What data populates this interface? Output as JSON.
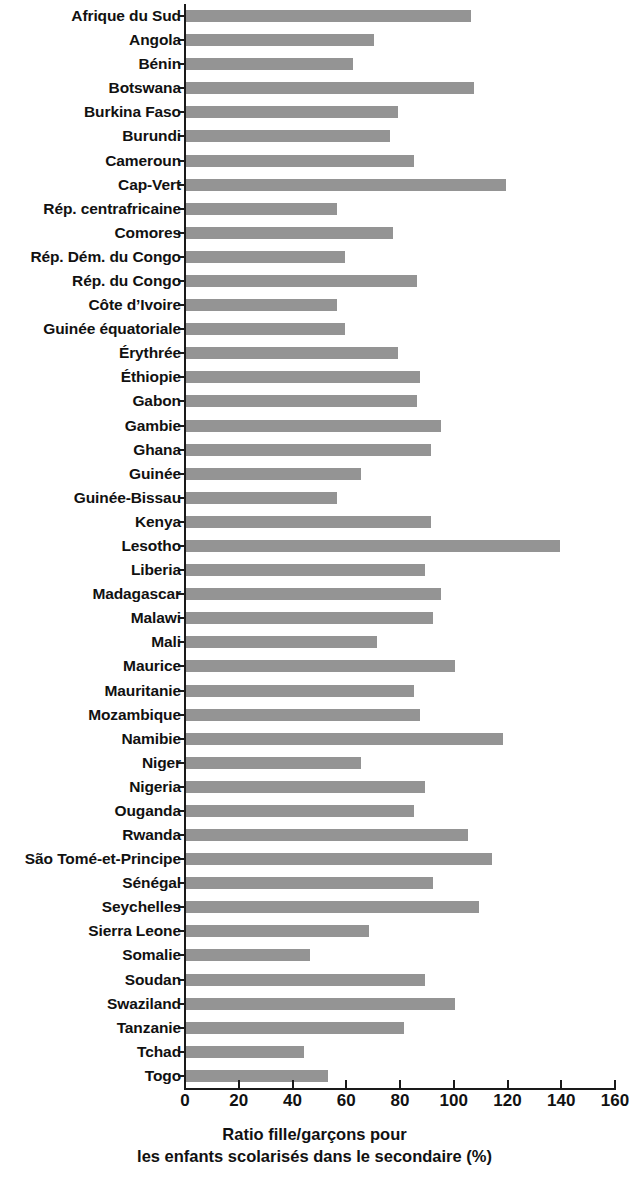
{
  "chart_data": {
    "type": "bar",
    "orientation": "horizontal",
    "title": "",
    "xlabel": "Ratio fille/garçons pour les enfants scolarisés dans le secondaire (%)",
    "xlabel_line1": "Ratio fille/garçons pour",
    "xlabel_line2": "les enfants scolarisés dans le secondaire (%)",
    "ylabel": "",
    "xlim": [
      0,
      160
    ],
    "xticks": [
      0,
      20,
      40,
      60,
      80,
      100,
      120,
      140,
      160
    ],
    "xtick_labels": [
      "0",
      "20",
      "40",
      "60",
      "80",
      "100",
      "120",
      "140",
      "160"
    ],
    "grid": false,
    "legend": null,
    "bar_color": "#949494",
    "axis_color": "#1a1a1a",
    "categories": [
      "Afrique du Sud",
      "Angola",
      "Bénin",
      "Botswana",
      "Burkina Faso",
      "Burundi",
      "Cameroun",
      "Cap-Vert",
      "Rép. centrafricaine",
      "Comores",
      "Rép. Dém. du Congo",
      "Rép. du Congo",
      "Côte d’Ivoire",
      "Guinée équatoriale",
      "Érythrée",
      "Éthiopie",
      "Gabon",
      "Gambie",
      "Ghana",
      "Guinée",
      "Guinée-Bissau",
      "Kenya",
      "Lesotho",
      "Liberia",
      "Madagascar",
      "Malawi",
      "Mali",
      "Maurice",
      "Mauritanie",
      "Mozambique",
      "Namibie",
      "Niger",
      "Nigeria",
      "Ouganda",
      "Rwanda",
      "São Tomé-et-Principe",
      "Sénégal",
      "Seychelles",
      "Sierra Leone",
      "Somalie",
      "Soudan",
      "Swaziland",
      "Tanzanie",
      "Tchad",
      "Togo"
    ],
    "values": [
      106,
      70,
      62,
      107,
      79,
      76,
      85,
      119,
      56,
      77,
      59,
      86,
      56,
      59,
      79,
      87,
      86,
      95,
      91,
      65,
      56,
      91,
      139,
      89,
      95,
      92,
      71,
      100,
      85,
      87,
      118,
      65,
      89,
      85,
      105,
      114,
      92,
      109,
      68,
      46,
      89,
      100,
      81,
      44,
      53
    ]
  }
}
